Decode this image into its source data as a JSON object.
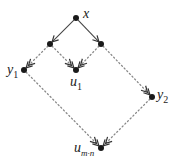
{
  "diagram": {
    "type": "lattice-diagram",
    "colors": {
      "node": "#1a1a1a",
      "solid_edge": "#444444",
      "dotted_edge": "#888888",
      "label": "#222222"
    },
    "nodes": [
      {
        "id": "x",
        "label": "x",
        "sub": "",
        "cx": 76,
        "cy": 18
      },
      {
        "id": "a",
        "label": "",
        "sub": "",
        "cx": 50,
        "cy": 44
      },
      {
        "id": "b",
        "label": "",
        "sub": "",
        "cx": 101,
        "cy": 44
      },
      {
        "id": "y1",
        "label": "y",
        "sub": "1",
        "cx": 24,
        "cy": 70
      },
      {
        "id": "u1",
        "label": "u",
        "sub": "1",
        "cx": 76,
        "cy": 70
      },
      {
        "id": "y2",
        "label": "y",
        "sub": "2",
        "cx": 152,
        "cy": 97
      },
      {
        "id": "umn",
        "label": "u",
        "sub": "m·n",
        "cx": 101,
        "cy": 148
      }
    ],
    "labels": {
      "x": "x",
      "y1_base": "y",
      "y1_sub": "1",
      "u1_base": "u",
      "u1_sub": "1",
      "y2_base": "y",
      "y2_sub": "2",
      "umn_base": "u",
      "umn_sub": "m·n"
    },
    "edges": [
      {
        "from": "x",
        "to": "a",
        "style": "solid",
        "head": "single"
      },
      {
        "from": "x",
        "to": "b",
        "style": "solid",
        "head": "single"
      },
      {
        "from": "a",
        "to": "y1",
        "style": "dotted",
        "head": "double"
      },
      {
        "from": "a",
        "to": "u1",
        "style": "dotted",
        "head": "double"
      },
      {
        "from": "b",
        "to": "u1",
        "style": "dotted",
        "head": "double"
      },
      {
        "from": "b",
        "to": "y2",
        "style": "dotted",
        "head": "double"
      },
      {
        "from": "y1",
        "to": "umn",
        "style": "dotted",
        "head": "double"
      },
      {
        "from": "y2",
        "to": "umn",
        "style": "dotted",
        "head": "double"
      }
    ]
  }
}
